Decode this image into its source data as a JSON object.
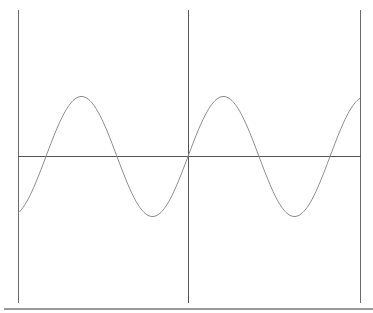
{
  "chart_data": {
    "type": "line",
    "title": "",
    "xlabel": "",
    "ylabel": "",
    "function": "y = sin(x)",
    "xlim": [
      -7.52,
      7.61
    ],
    "ylim": [
      -1.6,
      2.4
    ],
    "grid": false,
    "legend": null,
    "axes": {
      "x_axis_y": 0,
      "y_axis_x": 0,
      "frame_left_x": -7.52,
      "frame_right_x": 7.61
    },
    "series": [
      {
        "name": "sin(x)",
        "color": "#8c8c8c",
        "x": [
          -7.52,
          -6.28,
          -4.71,
          -3.14,
          -1.57,
          0,
          1.57,
          3.14,
          4.71,
          6.28,
          7.61
        ],
        "y": [
          -0.94,
          0,
          1,
          0,
          -1,
          0,
          1,
          0,
          -1,
          0,
          0.97
        ]
      }
    ],
    "colors": {
      "axis": "#555555",
      "curve": "#8c8c8c",
      "bottom_rule": "#9a9a9a"
    }
  }
}
